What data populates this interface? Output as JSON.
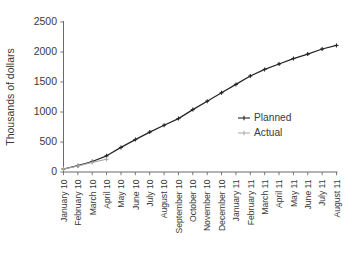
{
  "chart_data": {
    "type": "line",
    "title": "",
    "subtitle": "",
    "xlabel": "",
    "ylabel": "Thousands of dollars",
    "ylim": [
      0,
      2500
    ],
    "yticks": [
      0,
      500,
      1000,
      1500,
      2000,
      2500
    ],
    "ytick_labels": [
      "0",
      "500",
      "1000",
      "1500",
      "2000",
      "2500"
    ],
    "grid": false,
    "legend_position": "center-right",
    "categories": [
      "January 10",
      "February 10",
      "March 10",
      "April 10",
      "May 10",
      "June 10",
      "July 10",
      "August 10",
      "September 10",
      "October 10",
      "November 10",
      "December 10",
      "January 11",
      "February 11",
      "March 11",
      "April 11",
      "May 11",
      "June 11",
      "July 11",
      "August 11"
    ],
    "series": [
      {
        "name": "Planned",
        "color": "#242424",
        "marker": "cross",
        "values": [
          50,
          105,
          175,
          270,
          410,
          540,
          665,
          780,
          890,
          1040,
          1180,
          1320,
          1460,
          1600,
          1710,
          1800,
          1890,
          1965,
          2050,
          2110
        ]
      },
      {
        "name": "Actual",
        "color": "#a8a8a8",
        "marker": "cross",
        "values": [
          50,
          100,
          160,
          212,
          null,
          null,
          null,
          null,
          null,
          null,
          null,
          null,
          null,
          null,
          null,
          null,
          null,
          null,
          null,
          null
        ]
      }
    ]
  },
  "legend": {
    "entries": [
      {
        "label": "Planned",
        "color": "#242424"
      },
      {
        "label": "Actual",
        "color": "#a8a8a8"
      }
    ]
  },
  "axes": {
    "y_title": "Thousands of dollars"
  }
}
